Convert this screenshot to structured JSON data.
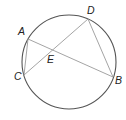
{
  "diagram": {
    "type": "circle-geometry",
    "circle": {
      "cx": 69,
      "cy": 62,
      "r": 47,
      "color": "#555555"
    },
    "points": {
      "A": {
        "x": 28,
        "y": 39,
        "label": "A",
        "lx": 18,
        "ly": 35
      },
      "B": {
        "x": 113,
        "y": 77,
        "label": "B",
        "lx": 115,
        "ly": 84
      },
      "C": {
        "x": 24,
        "y": 75,
        "label": "C",
        "lx": 14,
        "ly": 80
      },
      "D": {
        "x": 88,
        "y": 19,
        "label": "D",
        "lx": 87,
        "ly": 14
      },
      "E": {
        "x": 51,
        "y": 50,
        "label": "E",
        "lx": 47,
        "ly": 63
      }
    },
    "segments": [
      {
        "from": "A",
        "to": "B"
      },
      {
        "from": "C",
        "to": "D"
      },
      {
        "from": "A",
        "to": "C"
      },
      {
        "from": "D",
        "to": "B"
      }
    ],
    "line_color": "#9a9a9a"
  }
}
